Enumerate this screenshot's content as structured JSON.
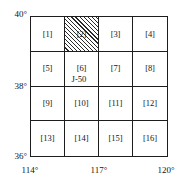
{
  "figure": {
    "name": "sheet-index-grid",
    "sheet_code": "J-50",
    "grid": {
      "rows": 4,
      "cols": 4,
      "cells": [
        [
          {
            "label": "[1]",
            "hatched": false
          },
          {
            "label": "[2]",
            "hatched": true
          },
          {
            "label": "[3]",
            "hatched": false
          },
          {
            "label": "[4]",
            "hatched": false
          }
        ],
        [
          {
            "label": "[5]",
            "hatched": false
          },
          {
            "label": "[6]",
            "hatched": false
          },
          {
            "label": "[7]",
            "hatched": false
          },
          {
            "label": "[8]",
            "hatched": false
          }
        ],
        [
          {
            "label": "[9]",
            "hatched": false
          },
          {
            "label": "[10]",
            "hatched": false
          },
          {
            "label": "[11]",
            "hatched": false
          },
          {
            "label": "[12]",
            "hatched": false
          }
        ],
        [
          {
            "label": "[13]",
            "hatched": false
          },
          {
            "label": "[14]",
            "hatched": false
          },
          {
            "label": "[15]",
            "hatched": false
          },
          {
            "label": "[16]",
            "hatched": false
          }
        ]
      ]
    },
    "latitude_labels": [
      "40°",
      "38°",
      "36°"
    ],
    "longitude_labels": [
      "114°",
      "117°",
      "120°"
    ]
  },
  "chart_data": {
    "type": "heatmap",
    "title": "J-50",
    "xlabel": "",
    "ylabel": "",
    "grid": true,
    "legend": "none",
    "categories": [
      "[1]",
      "[2]",
      "[3]",
      "[4]",
      "[5]",
      "[6]",
      "[7]",
      "[8]",
      "[9]",
      "[10]",
      "[11]",
      "[12]",
      "[13]",
      "[14]",
      "[15]",
      "[16]"
    ],
    "values": [
      0,
      1,
      0,
      0,
      0,
      0,
      0,
      0,
      0,
      0,
      0,
      0,
      0,
      0,
      0,
      0
    ],
    "highlighted_cells": [
      "[2]"
    ],
    "x": [
      114,
      117,
      120
    ],
    "y": [
      36,
      38,
      40
    ],
    "xlim": [
      114,
      120
    ],
    "ylim": [
      36,
      40
    ],
    "xtick_labels": [
      "114°",
      "117°",
      "120°"
    ],
    "ytick_labels": [
      "36°",
      "38°",
      "40°"
    ],
    "annotations": [
      "J-50"
    ]
  }
}
